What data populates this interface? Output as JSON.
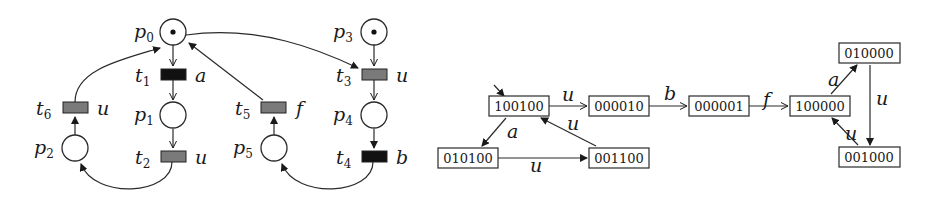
{
  "petri_net": {
    "places": [
      {
        "id": "p0",
        "name": "p",
        "sub": "0",
        "token": true
      },
      {
        "id": "p1",
        "name": "p",
        "sub": "1",
        "token": false
      },
      {
        "id": "p2",
        "name": "p",
        "sub": "2",
        "token": false
      },
      {
        "id": "p3",
        "name": "p",
        "sub": "3",
        "token": true
      },
      {
        "id": "p4",
        "name": "p",
        "sub": "4",
        "token": false
      },
      {
        "id": "p5",
        "name": "p",
        "sub": "5",
        "token": false
      }
    ],
    "transitions": [
      {
        "id": "t1",
        "name": "t",
        "sub": "1",
        "label": "a",
        "fill": "#111111"
      },
      {
        "id": "t2",
        "name": "t",
        "sub": "2",
        "label": "u",
        "fill": "#7a7a7a"
      },
      {
        "id": "t3",
        "name": "t",
        "sub": "3",
        "label": "u",
        "fill": "#7a7a7a"
      },
      {
        "id": "t4",
        "name": "t",
        "sub": "4",
        "label": "b",
        "fill": "#111111"
      },
      {
        "id": "t5",
        "name": "t",
        "sub": "5",
        "label": "f",
        "fill": "#7a7a7a"
      },
      {
        "id": "t6",
        "name": "t",
        "sub": "6",
        "label": "u",
        "fill": "#7a7a7a"
      }
    ]
  },
  "reachability_graph": {
    "states": [
      {
        "id": "s100100",
        "label": "100100",
        "initial": true
      },
      {
        "id": "s000010",
        "label": "000010"
      },
      {
        "id": "s000001",
        "label": "000001"
      },
      {
        "id": "s100000",
        "label": "100000"
      },
      {
        "id": "s010000",
        "label": "010000"
      },
      {
        "id": "s001000",
        "label": "001000"
      },
      {
        "id": "s010100",
        "label": "010100"
      },
      {
        "id": "s001100",
        "label": "001100"
      }
    ],
    "edges": [
      {
        "from": "100100",
        "to": "000010",
        "label": "u"
      },
      {
        "from": "000010",
        "to": "000001",
        "label": "b"
      },
      {
        "from": "000001",
        "to": "100000",
        "label": "f"
      },
      {
        "from": "100000",
        "to": "010000",
        "label": "a"
      },
      {
        "from": "010000",
        "to": "001000",
        "label": "u"
      },
      {
        "from": "001000",
        "to": "100000",
        "label": "u"
      },
      {
        "from": "100100",
        "to": "010100",
        "label": "a"
      },
      {
        "from": "010100",
        "to": "001100",
        "label": "u"
      },
      {
        "from": "001100",
        "to": "100100",
        "label": "u"
      }
    ]
  }
}
